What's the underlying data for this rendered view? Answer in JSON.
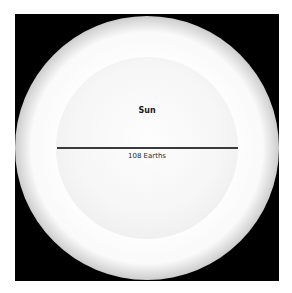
{
  "diagram": {
    "object_label": "Sun",
    "diameter_label": "108 Earths",
    "colors": {
      "background": "#000000",
      "disk": "#f6f6f6",
      "line": "#3a3a3a",
      "text": "#1a1a1a"
    }
  }
}
